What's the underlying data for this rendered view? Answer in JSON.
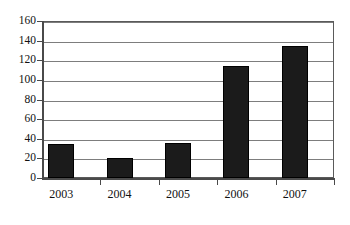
{
  "chart_data": {
    "type": "bar",
    "title": "",
    "subtitle": "",
    "xlabel": "",
    "ylabel": "",
    "categories": [
      "2003",
      "2004",
      "2005",
      "2006",
      "2007"
    ],
    "values": [
      35,
      20,
      36,
      114,
      135
    ],
    "series": [
      {
        "name": "",
        "values": [
          35,
          20,
          36,
          114,
          135
        ]
      }
    ],
    "ylim": [
      0,
      160
    ],
    "yticks": [
      0,
      20,
      40,
      60,
      80,
      100,
      120,
      140,
      160
    ],
    "ytick_labels": [
      "0",
      "20",
      "40",
      "60",
      "80",
      "100",
      "120",
      "140",
      "160"
    ],
    "grid": true,
    "grid_axis": "y",
    "legend": false,
    "legend_position": "none",
    "annotations": [],
    "colors": {
      "bar_fill": "#1b1b1b",
      "bar_stroke": "#000000",
      "gridline": "#7d7d7d",
      "axis": "#4a4a4a",
      "frame": "#5a5a5a",
      "background": "#ffffff",
      "text": "#111111"
    }
  }
}
